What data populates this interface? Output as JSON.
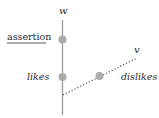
{
  "diagram": {
    "axes": {
      "vertical": {
        "label": "w"
      },
      "diagonal": {
        "label": "v"
      }
    },
    "nodes": [
      {
        "id": "assertion",
        "label": "assertion",
        "style": "underlined",
        "axis": "w"
      },
      {
        "id": "likes",
        "label": "likes",
        "style": "italic",
        "axis": "w"
      },
      {
        "id": "dislikes",
        "label": "dislikes",
        "style": "italic",
        "axis": "v"
      }
    ],
    "colors": {
      "axis_line": "#9a9a9a",
      "dot": "#ababab",
      "dotted_line": "#555555",
      "text": "#2b2b2b"
    }
  }
}
